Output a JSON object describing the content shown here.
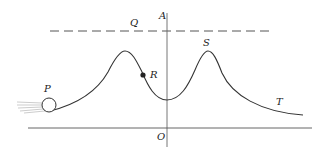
{
  "diagram": {
    "type": "potential-energy-curve",
    "labels": {
      "A": "A",
      "O": "O",
      "P": "P",
      "Q": "Q",
      "R": "R",
      "S": "S",
      "T": "T"
    },
    "elements": {
      "ball": "P",
      "point_on_curve": "R",
      "second_peak": "S",
      "right_tail": "T",
      "energy_level_line": "Q",
      "vertical_axis": "A-O"
    },
    "colors": {
      "stroke": "#333333",
      "background": "#ffffff"
    }
  }
}
